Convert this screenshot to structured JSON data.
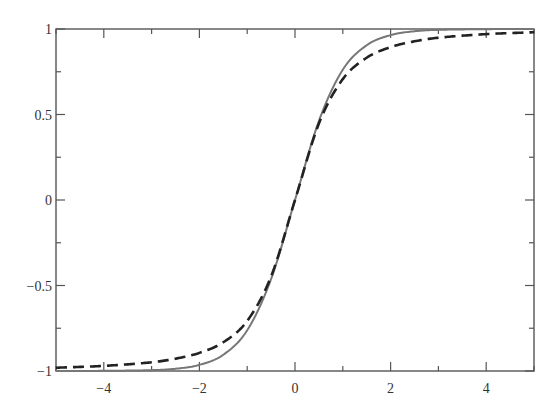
{
  "chart_data": {
    "type": "line",
    "title": "",
    "xlabel": "",
    "ylabel": "",
    "xlim": [
      -5,
      5
    ],
    "ylim": [
      -1,
      1
    ],
    "grid": false,
    "legend": null,
    "x_ticks": [
      -4,
      -2,
      0,
      2,
      4
    ],
    "x_tick_labels": [
      "−4",
      "−2",
      "0",
      "2",
      "4"
    ],
    "x_minor_ticks": [
      -5,
      -3,
      -1,
      1,
      3,
      5
    ],
    "y_ticks": [
      -1,
      -0.5,
      0,
      0.5,
      1
    ],
    "y_tick_labels": [
      "−1",
      "−0.5",
      "0",
      "0.5",
      "1"
    ],
    "y_minor_ticks": [
      -0.75,
      -0.25,
      0.25,
      0.75
    ],
    "x": [
      -5,
      -4,
      -3,
      -2.5,
      -2,
      -1.5,
      -1,
      -0.5,
      0,
      0.5,
      1,
      1.5,
      2,
      2.5,
      3,
      4,
      5
    ],
    "series": [
      {
        "name": "solid",
        "style": "solid",
        "color": "#777777",
        "values": [
          -1.0,
          -0.999,
          -0.995,
          -0.987,
          -0.964,
          -0.905,
          -0.762,
          -0.462,
          0.0,
          0.462,
          0.762,
          0.905,
          0.964,
          0.987,
          0.995,
          0.999,
          1.0
        ]
      },
      {
        "name": "dashed",
        "style": "dashed",
        "color": "#222222",
        "values": [
          -0.981,
          -0.97,
          -0.949,
          -0.928,
          -0.894,
          -0.832,
          -0.707,
          -0.447,
          0.0,
          0.447,
          0.707,
          0.832,
          0.894,
          0.928,
          0.949,
          0.97,
          0.981
        ]
      }
    ]
  },
  "plot": {
    "frame": {
      "left": 56,
      "top": 29,
      "right": 534,
      "bottom": 371
    }
  }
}
